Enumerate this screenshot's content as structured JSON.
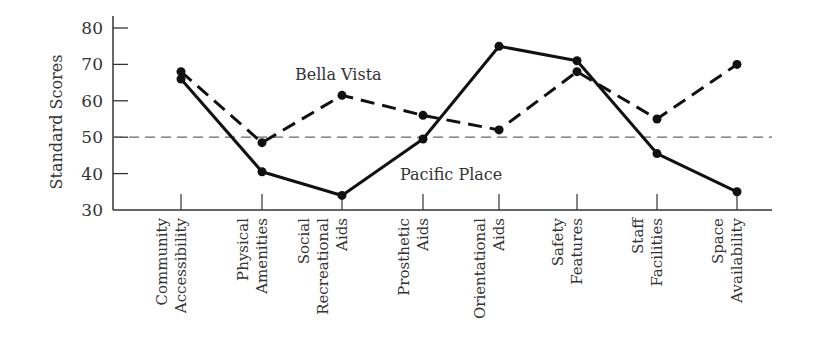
{
  "chart_data": {
    "type": "line",
    "title": "",
    "xlabel": "",
    "ylabel": "Standard Scores",
    "ylim": [
      30,
      80
    ],
    "yticks": [
      30,
      40,
      50,
      60,
      70,
      80
    ],
    "grid": false,
    "legend": "inline annotations",
    "reference_line": {
      "y": 50,
      "style": "dashed"
    },
    "categories": [
      [
        "Community",
        "Accessibility"
      ],
      [
        "Physical",
        "Amenities"
      ],
      [
        "Social",
        "Recreational",
        "Aids"
      ],
      [
        "Prosthetic",
        "Aids"
      ],
      [
        "Orientational",
        "Aids"
      ],
      [
        "Safety",
        "Features"
      ],
      [
        "Staff",
        "Facilities"
      ],
      [
        "Space",
        "Availability"
      ]
    ],
    "series": [
      {
        "name": "Bella Vista",
        "style": "dashed",
        "values": [
          68,
          48.5,
          61.5,
          56,
          52,
          68,
          55,
          70
        ]
      },
      {
        "name": "Pacific Place",
        "style": "solid",
        "values": [
          66,
          40.5,
          34,
          49.5,
          75,
          71,
          45.5,
          35
        ]
      }
    ],
    "annotations": [
      {
        "text": "Bella Vista",
        "x": 295,
        "y": 80
      },
      {
        "text": "Pacific Place",
        "x": 400,
        "y": 180
      }
    ]
  }
}
